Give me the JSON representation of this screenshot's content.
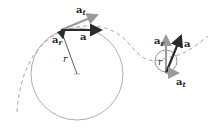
{
  "labels": {
    "left_at": {
      "base": "a",
      "sub": "t"
    },
    "left_a": {
      "base": "a"
    },
    "left_ar": {
      "base": "a",
      "sub": "r"
    },
    "left_r": "r",
    "right_ar": {
      "base": "a",
      "sub": "r"
    },
    "right_a": {
      "base": "a"
    },
    "right_at": {
      "base": "a",
      "sub": "t"
    },
    "right_r": "r"
  },
  "colors": {
    "dark": "#2b2b2b",
    "light": "#9a9a9a",
    "circle": "#999999",
    "path": "#aaaaaa"
  }
}
